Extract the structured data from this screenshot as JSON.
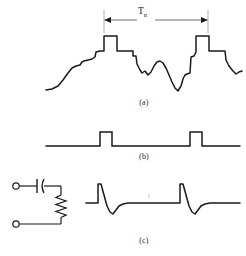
{
  "figure": {
    "stroke_color": "#1a1a1a",
    "background": "#ffffff",
    "panels": [
      {
        "id": "a",
        "caption": "(a)",
        "description": "Quasi-periodic ECG-like waveform with two tall square R-wave complexes separated by one period",
        "dimension": {
          "label": "T",
          "subscript": "n",
          "display": "Tn",
          "meaning": "beat-to-beat period",
          "left_x": 104,
          "right_x": 208,
          "y": 20
        }
      },
      {
        "id": "b",
        "caption": "(b)",
        "description": "Two rectangular gating pulses on a flat baseline, aligned with the R-wave peaks of panel (a)"
      },
      {
        "id": "c",
        "caption": "(c)",
        "description": "RC high-pass differentiator circuit and its output: sharp positive spike followed by negative exponential decay at each pulse edge",
        "current_label": "i",
        "circuit": {
          "elements": [
            "input-terminal-top",
            "capacitor",
            "resistor",
            "input-terminal-bottom"
          ],
          "capacitor_style": "one straight plate and one curved plate",
          "resistor_style": "vertical zigzag"
        }
      }
    ],
    "chart_data": {
      "type": "line",
      "title": "ECG signal, gating pulses and RC differentiator output",
      "xlabel": "",
      "ylabel": "",
      "grid": false,
      "legend": false,
      "series": [
        {
          "name": "(a) ECG-like signal",
          "points": [
            [
              46,
              90
            ],
            [
              52,
              89
            ],
            [
              58,
              86
            ],
            [
              63,
              80
            ],
            [
              68,
              73
            ],
            [
              72,
              68
            ],
            [
              76,
              66
            ],
            [
              80,
              65
            ],
            [
              82,
              62
            ],
            [
              84,
              61
            ],
            [
              88,
              60
            ],
            [
              92,
              59
            ],
            [
              95,
              57
            ],
            [
              96,
              52
            ],
            [
              100,
              51
            ],
            [
              104,
              51
            ],
            [
              104,
              36
            ],
            [
              117,
              36
            ],
            [
              117,
              51
            ],
            [
              133,
              51
            ],
            [
              133,
              56
            ],
            [
              136,
              56
            ],
            [
              137,
              64
            ],
            [
              140,
              70
            ],
            [
              142,
              73
            ],
            [
              145,
              71
            ],
            [
              148,
              75
            ],
            [
              151,
              72
            ],
            [
              154,
              66
            ],
            [
              157,
              62
            ],
            [
              160,
              61
            ],
            [
              163,
              63
            ],
            [
              166,
              68
            ],
            [
              169,
              75
            ],
            [
              172,
              82
            ],
            [
              175,
              88
            ],
            [
              178,
              91
            ],
            [
              181,
              86
            ],
            [
              183,
              79
            ],
            [
              185,
              75
            ],
            [
              187,
              74
            ],
            [
              190,
              73
            ],
            [
              191,
              57
            ],
            [
              194,
              56
            ],
            [
              196,
              52
            ],
            [
              196,
              36
            ],
            [
              209,
              36
            ],
            [
              209,
              51
            ],
            [
              225,
              51
            ],
            [
              226,
              60
            ],
            [
              229,
              66
            ],
            [
              233,
              71
            ],
            [
              236,
              74
            ],
            [
              239,
              72
            ],
            [
              242,
              71
            ]
          ]
        },
        {
          "name": "(b) gating pulses",
          "points": [
            [
              46,
              146
            ],
            [
              100,
              146
            ],
            [
              100,
              132
            ],
            [
              112,
              132
            ],
            [
              112,
              146
            ],
            [
              190,
              146
            ],
            [
              190,
              132
            ],
            [
              202,
              132
            ],
            [
              202,
              146
            ],
            [
              240,
              146
            ]
          ]
        },
        {
          "name": "(c) differentiated spikes",
          "points": [
            [
              86,
              203
            ],
            [
              98,
              203
            ],
            [
              98,
              184
            ],
            [
              101,
              184
            ],
            [
              104,
              195
            ],
            [
              107,
              206
            ],
            [
              110,
              212
            ],
            [
              113,
              214
            ],
            [
              116,
              210
            ],
            [
              119,
              206
            ],
            [
              123,
              204
            ],
            [
              128,
              203
            ],
            [
              180,
              203
            ],
            [
              180,
              184
            ],
            [
              183,
              184
            ],
            [
              186,
              195
            ],
            [
              189,
              206
            ],
            [
              192,
              212
            ],
            [
              195,
              214
            ],
            [
              198,
              210
            ],
            [
              201,
              206
            ],
            [
              205,
              204
            ],
            [
              210,
              203
            ],
            [
              240,
              203
            ]
          ]
        }
      ]
    }
  }
}
